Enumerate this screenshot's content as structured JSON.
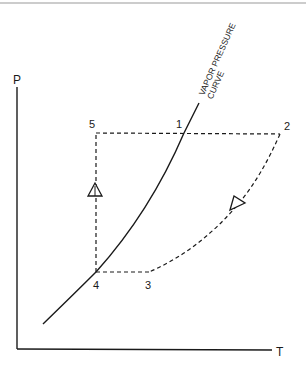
{
  "axes": {
    "y_label": "P",
    "x_label": "T"
  },
  "curve": {
    "label_line1": "VAPOR PRESSURE",
    "label_line2": "CURVE"
  },
  "points": [
    {
      "id": "1",
      "label": "1"
    },
    {
      "id": "2",
      "label": "2"
    },
    {
      "id": "3",
      "label": "3"
    },
    {
      "id": "4",
      "label": "4"
    },
    {
      "id": "5",
      "label": "5"
    }
  ],
  "colors": {
    "ink": "#1a1a1a",
    "frame": "#9a9a9a"
  }
}
